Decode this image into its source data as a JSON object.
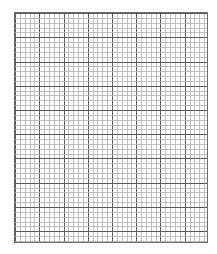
{
  "page": {
    "type": "graph-paper",
    "background_color": "#ffffff"
  },
  "grid": {
    "left": 14,
    "top": 12,
    "width": 194,
    "height": 231,
    "minor_cell_px": 4.85,
    "minor_per_major": 5,
    "major_columns": 8,
    "major_rows": 9.5,
    "minor_line_color": "#b0b0b0",
    "major_line_color": "#5a5a5a",
    "border_color": "#6a6a6a"
  },
  "footer": {
    "text": ""
  }
}
